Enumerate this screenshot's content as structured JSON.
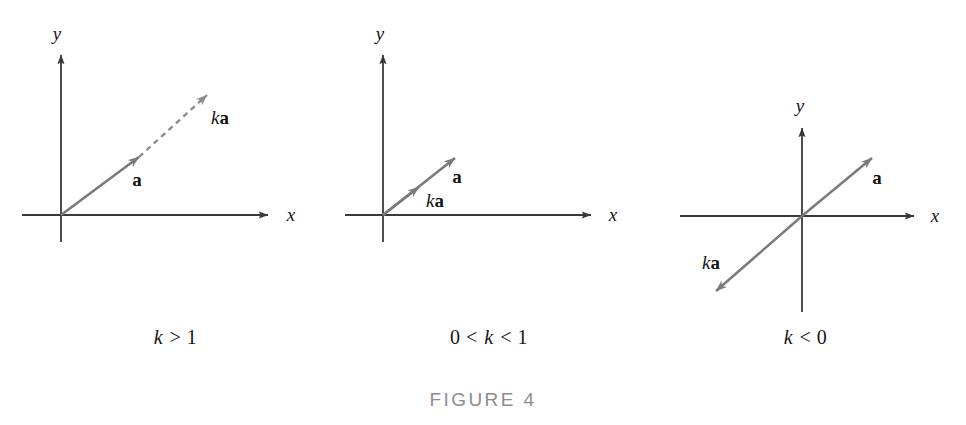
{
  "figure": {
    "title": "FIGURE 4",
    "axis_color": "#3a3a3a",
    "vector_color": "#7b7b7b",
    "text_color": "#151515",
    "title_color": "#8c8c8c",
    "background": "#ffffff"
  },
  "panels": [
    {
      "id": "panel-k-greater-than-1",
      "caption": {
        "full": "k > 1",
        "parts": [
          {
            "text": "k",
            "style": "italic"
          },
          {
            "text": " > 1",
            "style": "roman"
          }
        ]
      },
      "axes": {
        "x_label": "x",
        "y_label": "y"
      },
      "vectors": [
        {
          "name": "a",
          "label_parts": [
            {
              "text": "a",
              "style": "bold"
            }
          ],
          "stroke": "solid",
          "from": "origin",
          "direction": "up-right"
        },
        {
          "name": "ka",
          "label_parts": [
            {
              "text": "k",
              "style": "italic"
            },
            {
              "text": "a",
              "style": "bold"
            }
          ],
          "stroke": "dashed",
          "from": "tip-of-a",
          "direction": "up-right"
        }
      ]
    },
    {
      "id": "panel-k-between-0-and-1",
      "caption": {
        "full": "0 < k < 1",
        "parts": [
          {
            "text": "0 < ",
            "style": "roman"
          },
          {
            "text": "k",
            "style": "italic"
          },
          {
            "text": " < 1",
            "style": "roman"
          }
        ]
      },
      "axes": {
        "x_label": "x",
        "y_label": "y"
      },
      "vectors": [
        {
          "name": "a",
          "label_parts": [
            {
              "text": "a",
              "style": "bold"
            }
          ],
          "stroke": "solid",
          "from": "origin",
          "direction": "up-right"
        },
        {
          "name": "ka",
          "label_parts": [
            {
              "text": "k",
              "style": "italic"
            },
            {
              "text": "a",
              "style": "bold"
            }
          ],
          "stroke": "solid",
          "from": "origin",
          "direction": "up-right"
        }
      ]
    },
    {
      "id": "panel-k-less-than-0",
      "caption": {
        "full": "k < 0",
        "parts": [
          {
            "text": "k",
            "style": "italic"
          },
          {
            "text": " < 0",
            "style": "roman"
          }
        ]
      },
      "axes": {
        "x_label": "x",
        "y_label": "y"
      },
      "vectors": [
        {
          "name": "a",
          "label_parts": [
            {
              "text": "a",
              "style": "bold"
            }
          ],
          "stroke": "solid",
          "from": "origin",
          "direction": "up-right"
        },
        {
          "name": "ka",
          "label_parts": [
            {
              "text": "k",
              "style": "italic"
            },
            {
              "text": "a",
              "style": "bold"
            }
          ],
          "stroke": "solid",
          "from": "origin",
          "direction": "down-left"
        }
      ]
    }
  ]
}
